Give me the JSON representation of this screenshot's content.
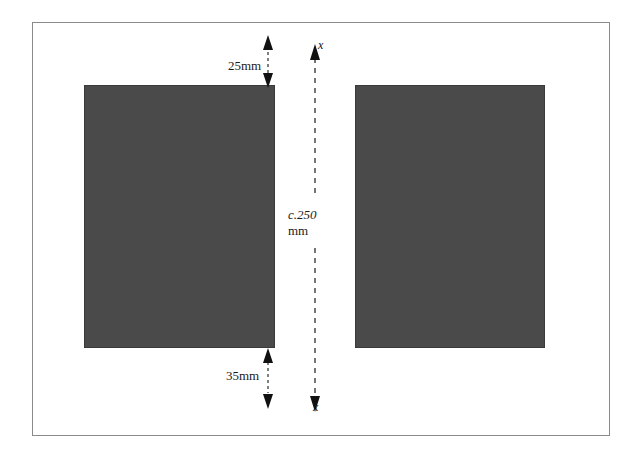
{
  "figure": {
    "type": "engineering-dimension-diagram",
    "frame": {
      "border_color": "#8a8a8a",
      "background": "#ffffff"
    },
    "blocks": [
      {
        "id": "left",
        "name": "left-hatched-block",
        "fill_pattern": "horizontal-dash-brick-hatch",
        "stroke_color": "#3a3a3a"
      },
      {
        "id": "right",
        "name": "right-hatched-block",
        "fill_pattern": "horizontal-dash-brick-hatch",
        "stroke_color": "#3a3a3a"
      }
    ],
    "dimensions": [
      {
        "id": "top-gap",
        "label": "25mm",
        "value": 25,
        "unit": "mm",
        "arrow": "double-headed-vertical"
      },
      {
        "id": "bottom-gap",
        "label": "35mm",
        "value": 35,
        "unit": "mm",
        "arrow": "double-headed-vertical"
      }
    ],
    "axis": {
      "name": "section-axis-x-x",
      "label_prefix": "c.",
      "label_value": "250",
      "label_line1": "c.250",
      "label_line2": "mm",
      "top_marker": "x",
      "bottom_marker": "x",
      "line_style": "dashed",
      "arrow": "double-headed-vertical"
    },
    "colors": {
      "ink": "#1a1a1a",
      "hatch": "#4a4a4a",
      "frame": "#8a8a8a",
      "paper": "#ffffff"
    }
  }
}
